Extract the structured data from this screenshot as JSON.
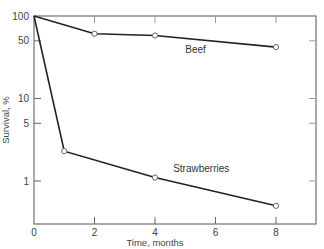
{
  "chart_data": {
    "type": "line",
    "title": "",
    "xlabel": "Time, months",
    "ylabel": "Survival, %",
    "xlim": [
      0,
      9.3
    ],
    "ylim": [
      0.4,
      100
    ],
    "yscale": "log",
    "grid": false,
    "legend": "inline labels",
    "x_ticks": [
      0,
      2,
      4,
      6,
      8
    ],
    "x_tick_labels": [
      "0",
      "2",
      "4",
      "6",
      "8"
    ],
    "y_ticks": [
      1,
      5,
      10,
      50,
      100
    ],
    "y_tick_labels": [
      "1",
      "5",
      "10",
      "50",
      "100"
    ],
    "series": [
      {
        "name": "Beef",
        "x": [
          0,
          2,
          4,
          8
        ],
        "values": [
          100,
          61,
          58,
          42
        ],
        "label_pos": {
          "x": 5.0,
          "y": 36
        }
      },
      {
        "name": "Strawberries",
        "x": [
          0,
          1,
          4,
          8
        ],
        "values": [
          100,
          2.3,
          1.1,
          0.5
        ],
        "label_pos": {
          "x": 4.6,
          "y": 1.3
        }
      }
    ]
  }
}
